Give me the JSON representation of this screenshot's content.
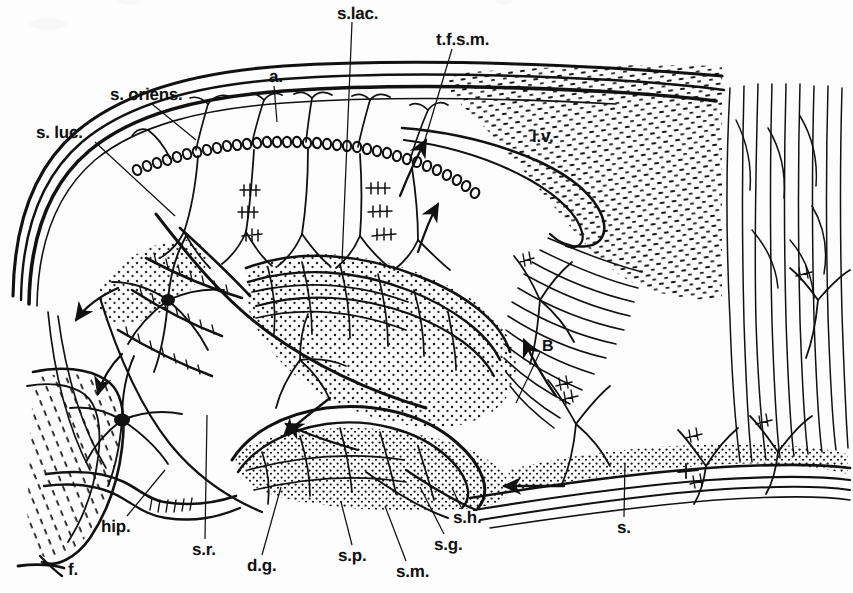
{
  "figure": {
    "background_color": "#fdfdfd",
    "ink_color": "#111111",
    "width": 853,
    "height": 593
  },
  "labels": [
    {
      "id": "s-lac",
      "text": "s.lac.",
      "x": 337,
      "y": 5,
      "leader": [
        [
          352,
          22
        ],
        [
          342,
          262
        ]
      ]
    },
    {
      "id": "tfsm",
      "text": "t.f.s.m.",
      "x": 436,
      "y": 31,
      "leader": [
        [
          452,
          49
        ],
        [
          424,
          143
        ]
      ]
    },
    {
      "id": "s-oriens",
      "text": "s. oriens.",
      "x": 110,
      "y": 86,
      "leader": [
        [
          152,
          104
        ],
        [
          196,
          140
        ]
      ]
    },
    {
      "id": "a",
      "text": "a.",
      "x": 269,
      "y": 68,
      "leader": [
        [
          274,
          86
        ],
        [
          277,
          122
        ]
      ]
    },
    {
      "id": "s-luc",
      "text": "s. luc.",
      "x": 36,
      "y": 124,
      "leader": [
        [
          95,
          142
        ],
        [
          175,
          216
        ]
      ]
    },
    {
      "id": "lv",
      "text": "l.v.",
      "x": 532,
      "y": 128,
      "leader": null
    },
    {
      "id": "B",
      "text": "B",
      "x": 542,
      "y": 339,
      "leader": [
        [
          540,
          352
        ],
        [
          516,
          403
        ]
      ]
    },
    {
      "id": "hip",
      "text": "hip.",
      "x": 101,
      "y": 518,
      "leader": [
        [
          127,
          516
        ],
        [
          165,
          470
        ]
      ]
    },
    {
      "id": "s-r",
      "text": "s.r.",
      "x": 192,
      "y": 541,
      "leader": [
        [
          205,
          539
        ],
        [
          207,
          415
        ]
      ]
    },
    {
      "id": "d-g",
      "text": "d.g.",
      "x": 247,
      "y": 557,
      "leader": [
        [
          262,
          555
        ],
        [
          281,
          487
        ]
      ]
    },
    {
      "id": "s-p",
      "text": "s.p.",
      "x": 338,
      "y": 547,
      "leader": [
        [
          352,
          545
        ],
        [
          341,
          502
        ]
      ]
    },
    {
      "id": "s-m",
      "text": "s.m.",
      "x": 396,
      "y": 563,
      "leader": [
        [
          406,
          561
        ],
        [
          385,
          506
        ]
      ]
    },
    {
      "id": "s-g",
      "text": "s.g.",
      "x": 434,
      "y": 536,
      "leader": [
        [
          444,
          534
        ],
        [
          420,
          487
        ]
      ]
    },
    {
      "id": "s-h",
      "text": "s.h.",
      "x": 453,
      "y": 509,
      "leader": [
        [
          461,
          507
        ],
        [
          452,
          488
        ]
      ]
    },
    {
      "id": "s",
      "text": "s.",
      "x": 617,
      "y": 519,
      "leader": [
        [
          624,
          517
        ],
        [
          625,
          463
        ]
      ]
    },
    {
      "id": "f",
      "text": "f.",
      "x": 68,
      "y": 561,
      "leader": null
    }
  ],
  "structures": {
    "alveus": "alveus / outer fiber sheet along dorsal CA1",
    "stratum_oriens": "stratum oriens",
    "stratum_pyramidale": "pyramidal cell layer (pearl-chain of somata)",
    "stratum_lucidum": "stratum lucidum",
    "stratum_radiatum": "stratum radiatum",
    "stratum_lacunosum": "stratum lacunosum",
    "tfsm": "tractus fibrarum substantiae medullaris",
    "lateral_ventricle": "lateral ventricle",
    "dentate_gyrus": "dentate gyrus",
    "fimbria": "fimbria",
    "subiculum": "subiculum / cortical continuation at right"
  }
}
